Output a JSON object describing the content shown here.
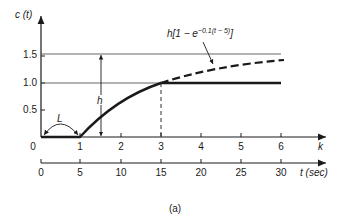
{
  "figure": {
    "caption": "(a)",
    "y_axis_label": "c (t)",
    "y_ticks": [
      "0.5",
      "1.0",
      "1.5"
    ],
    "k_axis_label": "k",
    "k_ticks": [
      "0",
      "1",
      "2",
      "3",
      "4",
      "5",
      "6"
    ],
    "t_axis_label": "t (sec)",
    "t_ticks": [
      "0",
      "5",
      "10",
      "15",
      "20",
      "25",
      "30"
    ],
    "curve_label": "h[1 − e",
    "curve_label_exp": "−0.1(t − 5)",
    "curve_label_close": "]",
    "h_label": "h",
    "L_label": "L"
  },
  "colors": {
    "ink": "#1a1a1a",
    "thin": "#555555"
  }
}
